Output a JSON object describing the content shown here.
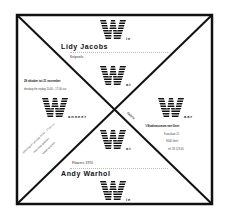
{
  "poster": {
    "sections": {
      "top": {
        "letter": "W",
        "suffix": "ie",
        "name": "Lidy Jacobs",
        "subtitle": "Knipsels"
      },
      "upper_center": {
        "letter": "W",
        "suffix": "at"
      },
      "left": {
        "letter": "W",
        "suffix": "anneer",
        "dates": "29 oktober tot 21 november",
        "hours": "dinsdag t/m vrijdag 10.00 - 17.00 uur",
        "diagonal_lines": [
          "zaterdag en zondag 14.00 - 17.00 uur",
          "maandag gesloten",
          "toegang gratis"
        ]
      },
      "right": {
        "letter": "W",
        "suffix": "aar",
        "rotated_label": "Galerie",
        "venue": "'t Stadsmuseum van Gent",
        "address_lines": [
          "Kunstlaan 21",
          "9000 Gent",
          "tel. 09 123 45"
        ]
      },
      "lower_center": {
        "letter": "W",
        "suffix": "at",
        "subtitle": "Flowers 1970"
      },
      "bottom": {
        "letter": "W",
        "suffix": "ie",
        "name": "Andy Warhol"
      }
    },
    "colors": {
      "ink": "#111111",
      "paper": "#ffffff"
    }
  }
}
